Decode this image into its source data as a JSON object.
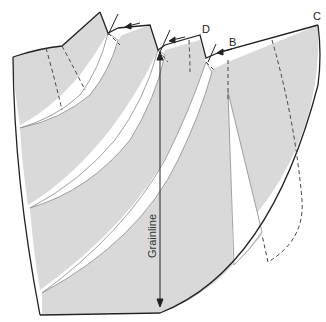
{
  "diagram": {
    "type": "sewing-pattern",
    "colors": {
      "fill": "#d9d9d9",
      "outline": "#222222",
      "slash_line": "#888888",
      "dashed": "#444444",
      "background": "#ffffff"
    },
    "labels": {
      "point_c": "C",
      "point_d": "D",
      "point_b": "B",
      "grainline": "Grainline"
    },
    "annotations": {
      "arrows": [
        "arrow-left-1",
        "arrow-left-2",
        "arrow-left-3"
      ],
      "grainline_direction": "vertical, arrowheads both ends"
    }
  }
}
